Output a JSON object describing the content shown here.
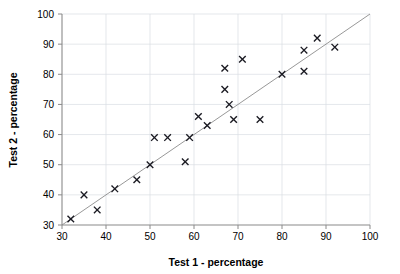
{
  "chart_data": {
    "type": "scatter",
    "title": "",
    "xlabel": "Test 1 - percentage",
    "ylabel": "Test 2 - percentage",
    "xlim": [
      30,
      100
    ],
    "ylim": [
      30,
      100
    ],
    "xticks": [
      30,
      40,
      50,
      60,
      70,
      80,
      90,
      100
    ],
    "yticks": [
      30,
      40,
      50,
      60,
      70,
      80,
      90,
      100
    ],
    "xtick_labels": [
      "30",
      "40",
      "50",
      "60",
      "70",
      "80",
      "90",
      "100"
    ],
    "ytick_labels": [
      "30",
      "40",
      "50",
      "60",
      "70",
      "80",
      "90",
      "100"
    ],
    "grid": true,
    "legend": null,
    "marker": "x",
    "marker_color": "#1a1a22",
    "grid_color": "#d8dce3",
    "axis_color": "#8a8a8a",
    "reference_line": {
      "name": "y = x line of equality",
      "from": [
        30,
        30
      ],
      "to": [
        100,
        100
      ],
      "color": "#8c8c8c"
    },
    "points": [
      {
        "x": 32,
        "y": 32
      },
      {
        "x": 35,
        "y": 40
      },
      {
        "x": 38,
        "y": 35
      },
      {
        "x": 42,
        "y": 42
      },
      {
        "x": 47,
        "y": 45
      },
      {
        "x": 50,
        "y": 50
      },
      {
        "x": 51,
        "y": 59
      },
      {
        "x": 54,
        "y": 59
      },
      {
        "x": 58,
        "y": 51
      },
      {
        "x": 59,
        "y": 59
      },
      {
        "x": 61,
        "y": 66
      },
      {
        "x": 63,
        "y": 63
      },
      {
        "x": 67,
        "y": 82
      },
      {
        "x": 67,
        "y": 75
      },
      {
        "x": 68,
        "y": 70
      },
      {
        "x": 69,
        "y": 65
      },
      {
        "x": 71,
        "y": 85
      },
      {
        "x": 75,
        "y": 65
      },
      {
        "x": 80,
        "y": 80
      },
      {
        "x": 85,
        "y": 88
      },
      {
        "x": 85,
        "y": 81
      },
      {
        "x": 88,
        "y": 92
      },
      {
        "x": 92,
        "y": 89
      }
    ]
  }
}
